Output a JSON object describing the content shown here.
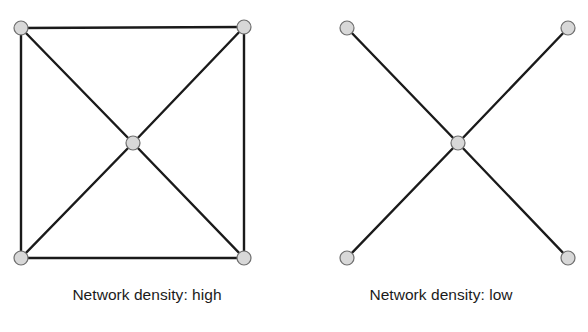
{
  "figure": {
    "background_color": "#ffffff",
    "panels": [
      {
        "id": "high",
        "caption": "Network density: high",
        "node_color": "#d8d8d8",
        "node_stroke_color": "#6e6e6e",
        "edge_color": "#1a1a1a",
        "node_radius": 7,
        "edge_width": 2.4,
        "nodes": [
          {
            "name": "top-left",
            "x": 21,
            "y": 28
          },
          {
            "name": "top-right",
            "x": 244,
            "y": 27
          },
          {
            "name": "center",
            "x": 133,
            "y": 143
          },
          {
            "name": "bottom-left",
            "x": 21,
            "y": 258
          },
          {
            "name": "bottom-right",
            "x": 244,
            "y": 258
          }
        ],
        "edges": [
          {
            "from": "top-left",
            "to": "top-right"
          },
          {
            "from": "top-left",
            "to": "bottom-left"
          },
          {
            "from": "top-right",
            "to": "bottom-right"
          },
          {
            "from": "bottom-left",
            "to": "bottom-right"
          },
          {
            "from": "top-left",
            "to": "center"
          },
          {
            "from": "top-right",
            "to": "center"
          },
          {
            "from": "bottom-left",
            "to": "center"
          },
          {
            "from": "bottom-right",
            "to": "center"
          }
        ]
      },
      {
        "id": "low",
        "caption": "Network density: low",
        "node_color": "#d8d8d8",
        "node_stroke_color": "#6e6e6e",
        "edge_color": "#1a1a1a",
        "node_radius": 7,
        "edge_width": 2.4,
        "nodes": [
          {
            "name": "top-left",
            "x": 53,
            "y": 28
          },
          {
            "name": "top-right",
            "x": 274,
            "y": 28
          },
          {
            "name": "center",
            "x": 164,
            "y": 143
          },
          {
            "name": "bottom-left",
            "x": 53,
            "y": 258
          },
          {
            "name": "bottom-right",
            "x": 274,
            "y": 258
          }
        ],
        "edges": [
          {
            "from": "top-left",
            "to": "center"
          },
          {
            "from": "top-right",
            "to": "center"
          },
          {
            "from": "bottom-left",
            "to": "center"
          },
          {
            "from": "bottom-right",
            "to": "center"
          }
        ]
      }
    ]
  },
  "chart_data": {
    "type": "diagram",
    "title": "",
    "subtype": "node-link-network-comparison",
    "panels": [
      {
        "label": "Network density: high",
        "node_count": 5,
        "edge_count": 8,
        "density": "high",
        "nodes": [
          "top-left",
          "top-right",
          "center",
          "bottom-left",
          "bottom-right"
        ],
        "edges": [
          [
            "top-left",
            "top-right"
          ],
          [
            "top-left",
            "bottom-left"
          ],
          [
            "top-right",
            "bottom-right"
          ],
          [
            "bottom-left",
            "bottom-right"
          ],
          [
            "top-left",
            "center"
          ],
          [
            "top-right",
            "center"
          ],
          [
            "bottom-left",
            "center"
          ],
          [
            "bottom-right",
            "center"
          ]
        ]
      },
      {
        "label": "Network density: low",
        "node_count": 5,
        "edge_count": 4,
        "density": "low",
        "nodes": [
          "top-left",
          "top-right",
          "center",
          "bottom-left",
          "bottom-right"
        ],
        "edges": [
          [
            "top-left",
            "center"
          ],
          [
            "top-right",
            "center"
          ],
          [
            "bottom-left",
            "center"
          ],
          [
            "bottom-right",
            "center"
          ]
        ]
      }
    ]
  }
}
